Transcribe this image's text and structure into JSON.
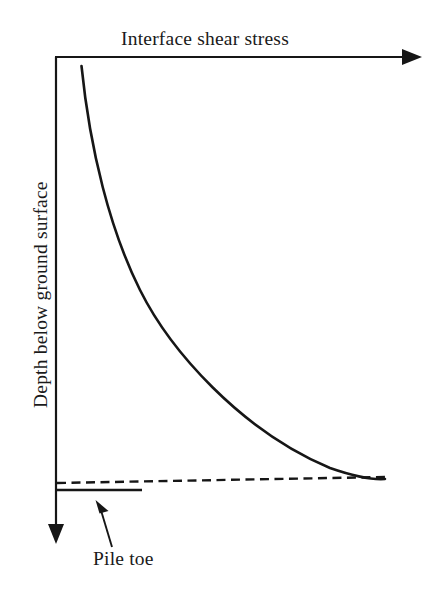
{
  "figure": {
    "type": "schematic-diagram",
    "x_axis_title": "Interface shear stress",
    "y_axis_title": "Depth below ground surface",
    "annotations": {
      "pile_toe_label": "Pile toe"
    },
    "colors": {
      "ink": "#161616",
      "background": "#ffffff"
    },
    "geometry": {
      "x_axis": {
        "x1": 55,
        "y1": 57,
        "x2": 402,
        "y2": 57,
        "arrow": "right"
      },
      "y_axis": {
        "x1": 56,
        "y1": 57,
        "x2": 56,
        "y2": 524,
        "arrow": "down"
      },
      "x_arrow_head": "402,49 422,57 402,65",
      "y_arrow_head": "48,524 56,544 64,524",
      "shear_curve": "M 81.5 66 C 90 150 110 230 140 290 C 170 350 240 430 330 468 C 356 477 372 480 385 479",
      "ground_dashed_line": {
        "x1": 57,
        "y1": 483,
        "x2": 385,
        "y2": 477
      },
      "pile_toe_line": {
        "x1": 56,
        "y1": 490,
        "x2": 142,
        "y2": 490
      },
      "pointer_line": {
        "x1": 112,
        "y1": 547,
        "x2": 101.5,
        "y2": 512
      },
      "pointer_head": "95.5,500 108.5,511 99.5,513.5"
    }
  }
}
